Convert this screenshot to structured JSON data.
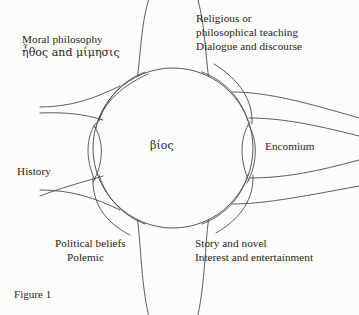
{
  "figure": {
    "caption": "Figure 1",
    "center_label": "βίος",
    "line_color": "#4e4b4c",
    "text_color": "#231f20",
    "background": "#fcfcfb"
  },
  "diagram": {
    "type": "radial-petal-diagram",
    "center": {
      "x": 173,
      "y": 148,
      "radius": 80
    },
    "petal_count": 6,
    "sectors": [
      {
        "id": "moral-philosophy",
        "direction": "upper-left",
        "lines": [
          "Moral philosophy",
          "ἦθος and μίμησις"
        ]
      },
      {
        "id": "religious-teaching",
        "direction": "upper-right",
        "lines": [
          "Religious or",
          "philosophical teaching",
          "Dialogue and discourse"
        ]
      },
      {
        "id": "encomium",
        "direction": "right",
        "lines": [
          "Encomium"
        ]
      },
      {
        "id": "story-and-novel",
        "direction": "lower-right",
        "lines": [
          "Story and novel",
          "Interest and entertainment"
        ]
      },
      {
        "id": "political-beliefs",
        "direction": "lower-left",
        "lines": [
          "Political beliefs",
          "Polemic"
        ]
      },
      {
        "id": "history",
        "direction": "left",
        "lines": [
          "History"
        ]
      }
    ]
  }
}
